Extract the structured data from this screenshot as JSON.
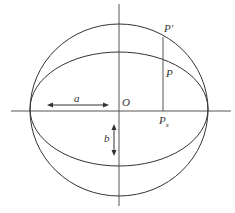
{
  "diagram": {
    "labels": {
      "origin": "O",
      "point_circle": "P'",
      "point_ellipse": "P",
      "foot_base": "P",
      "foot_sub": "x",
      "semi_major": "a",
      "semi_minor": "b"
    },
    "geometry": {
      "center": [
        119,
        111
      ],
      "circle": {
        "rx": 89,
        "ry": 85
      },
      "ellipse": {
        "rx": 89,
        "ry": 57
      },
      "projection_x": 163
    },
    "colors": {
      "stroke": "#333333",
      "axis": "#555555"
    }
  }
}
